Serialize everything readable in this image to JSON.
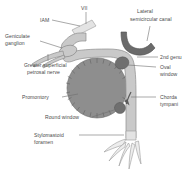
{
  "figure": {
    "background_color": "#ffffff"
  },
  "labels": {
    "vii": "VII",
    "iam": "IAM",
    "geniculate_ganglion_line1": "Geniculate",
    "geniculate_ganglion_line2": "ganglion",
    "lateral_semicircular_canal_line1": "Lateral",
    "lateral_semicircular_canal_line2": "semicircular canal",
    "gspn_line1": "Greater superficial",
    "gspn_line2": "petrosal nerve",
    "second_genu": "2nd genu",
    "oval_window_line1": "Oval",
    "oval_window_line2": "window",
    "chorda_tympani_line1": "Chorda",
    "chorda_tympani_line2": "tympani",
    "promontory": "Promontory",
    "round_window": "Round window",
    "stylomastoid_foramen_line1": "Stylomastoid",
    "stylomastoid_foramen_line2": "foramen"
  },
  "colors": {
    "nerve": "#c9c9c9",
    "nerve_outline": "#8d8d8d",
    "nerve_light": "#e3e3e3",
    "canal_dark": "#6b6b6b",
    "promontory": "#8e8e8e",
    "window_dark": "#6f6f6f",
    "label_text": "#4a4a4a",
    "leader_line": "#6e6e6e"
  },
  "structures": [
    {
      "name": "facial-nerve-trunk",
      "kind": "nerve-path"
    },
    {
      "name": "internal-auditory-meatus",
      "kind": "nerve-segment"
    },
    {
      "name": "geniculate-ganglion",
      "kind": "ganglion"
    },
    {
      "name": "greater-superficial-petrosal-nerve",
      "kind": "nerve-branch"
    },
    {
      "name": "lateral-semicircular-canal",
      "kind": "bony-canal"
    },
    {
      "name": "second-genu",
      "kind": "nerve-bend"
    },
    {
      "name": "oval-window",
      "kind": "window"
    },
    {
      "name": "round-window",
      "kind": "window"
    },
    {
      "name": "promontory",
      "kind": "bony-prominence"
    },
    {
      "name": "chorda-tympani",
      "kind": "nerve-branch"
    },
    {
      "name": "stylomastoid-foramen",
      "kind": "foramen"
    },
    {
      "name": "pes-anserinus-terminal-branches",
      "kind": "nerve-branches"
    }
  ]
}
